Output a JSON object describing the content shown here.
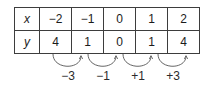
{
  "figure": {
    "type": "value-table-with-differences",
    "table": {
      "row_labels": [
        "x",
        "y"
      ],
      "rows": [
        {
          "label": "x",
          "cells": [
            "−2",
            "−1",
            "0",
            "1",
            "2"
          ]
        },
        {
          "label": "y",
          "cells": [
            "4",
            "1",
            "0",
            "1",
            "4"
          ]
        }
      ]
    },
    "differences": {
      "labels": [
        "−3",
        "−1",
        "+1",
        "+3"
      ],
      "arrow_name": "curved-difference-arrow"
    },
    "colors": {
      "border": "#3d3d3d",
      "inner_border": "#bdbdbd",
      "text": "#1b1b1b",
      "arrow": "#555555",
      "label_text": "#2b2b2b",
      "background": "#ffffff"
    }
  }
}
